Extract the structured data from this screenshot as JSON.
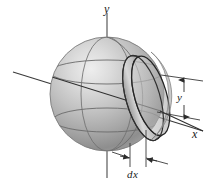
{
  "figure": {
    "background_color": "#ffffff",
    "line_color": "#2b2b2b",
    "sphere": {
      "name": "sphere",
      "center_x": 107,
      "center_y": 94,
      "radius": 57,
      "fill_light": "#e8e8e8",
      "fill_mid": "#b4b4b4",
      "fill_dark": "#8a8a8a",
      "outline_color": "#6d6d6d"
    },
    "disk": {
      "name": "elemental-disk",
      "center_x": 145,
      "center_y": 98,
      "semi_major": 42,
      "semi_minor": 17,
      "thickness_px": 8,
      "rotation_deg": -16,
      "fill": "#cfcfcf",
      "edge": "#2f2f2f"
    },
    "axes": [
      {
        "name": "y-axis",
        "label": "y",
        "orientation": "vertical",
        "x1": 107,
        "y1": 13,
        "x2": 107,
        "y2": 178
      },
      {
        "name": "x-axis",
        "label": "x",
        "orientation": "oblique-right-down",
        "x1": 13,
        "y1": 72,
        "x2": 203,
        "y2": 131
      }
    ],
    "dimensions": [
      {
        "name": "disk-radius",
        "label": "y",
        "kind": "vertical-double-arrow",
        "from_y": 80,
        "to_y": 117,
        "at_x": 184,
        "leader_top": {
          "x1": 162,
          "y1": 77,
          "x2": 202,
          "y2": 80
        },
        "leader_bottom": {
          "x1": 158,
          "y1": 113,
          "x2": 199,
          "y2": 119
        }
      },
      {
        "name": "disk-thickness",
        "label": "dx",
        "kind": "horizontal-double-arrow",
        "from_x": 131,
        "to_x": 146,
        "at_y": 162,
        "leader_left": {
          "x1": 131,
          "y1": 141,
          "x2": 131,
          "y2": 166
        },
        "leader_right": {
          "x1": 146,
          "y1": 131,
          "x2": 146,
          "y2": 166
        }
      }
    ],
    "labels": {
      "y_axis": "y",
      "x_axis": "x",
      "disk_radius": "y",
      "disk_thickness": "dx"
    }
  }
}
